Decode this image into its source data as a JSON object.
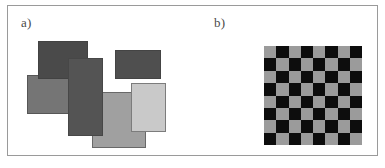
{
  "figure": {
    "background_color": "#ffffff",
    "frame_border_color": "#9a9a9a",
    "width": 385,
    "height": 168
  },
  "panels": [
    {
      "id": "a",
      "label": "a)",
      "label_x": 21,
      "label_y": 16,
      "description": "overlapping gray rectangles"
    },
    {
      "id": "b",
      "label": "b)",
      "label_x": 214,
      "label_y": 16,
      "description": "checkerboard pattern"
    }
  ],
  "panel_a": {
    "rectangles": [
      {
        "name": "rect-dark-top-left",
        "x": 31,
        "y": 36,
        "w": 50,
        "h": 38,
        "color": "#4a4a4a",
        "z": 4
      },
      {
        "name": "rect-dark-top-right",
        "x": 108,
        "y": 45,
        "w": 46,
        "h": 29,
        "color": "#4f4f4f",
        "z": 3
      },
      {
        "name": "rect-gray-left",
        "x": 20,
        "y": 70,
        "w": 49,
        "h": 39,
        "color": "#757575",
        "z": 2
      },
      {
        "name": "rect-dark-center",
        "x": 61,
        "y": 53,
        "w": 35,
        "h": 78,
        "color": "#545454",
        "z": 5
      },
      {
        "name": "rect-midgray-bottom",
        "x": 85,
        "y": 87,
        "w": 54,
        "h": 56,
        "color": "#a0a0a0",
        "z": 1
      },
      {
        "name": "rect-light-right",
        "x": 124,
        "y": 78,
        "w": 35,
        "h": 49,
        "color": "#c9c9c9",
        "z": 6
      }
    ]
  },
  "panel_b": {
    "checkerboard": {
      "rows": 8,
      "cols": 8,
      "x": 264,
      "y": 46,
      "width": 98,
      "height": 99,
      "light_color": "#9b9b9b",
      "dark_color": "#0d0d0d",
      "start_with": "light"
    }
  }
}
